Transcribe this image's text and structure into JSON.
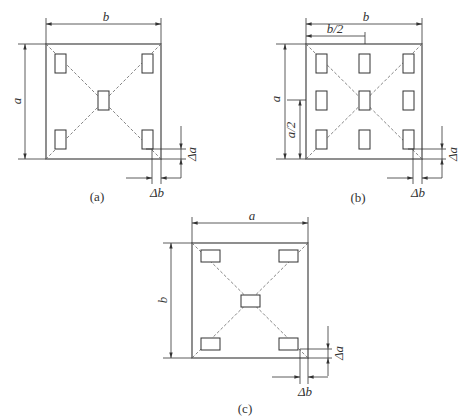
{
  "figures": [
    {
      "id": "a",
      "caption": "(a)",
      "labels": {
        "width": "b",
        "height": "a",
        "delta_a": "Δa",
        "delta_b": "Δb"
      },
      "pads": "5 pads: 4 corners + center, vertical orientation"
    },
    {
      "id": "b",
      "caption": "(b)",
      "labels": {
        "width": "b",
        "half_width": "b/2",
        "height": "a",
        "half_height": "a/2",
        "delta_a": "Δa",
        "delta_b": "Δb"
      },
      "pads": "9 pads: 3×3 grid, vertical orientation"
    },
    {
      "id": "c",
      "caption": "(c)",
      "labels": {
        "width": "a",
        "height": "b",
        "delta_a": "Δa",
        "delta_b": "Δb"
      },
      "pads": "5 pads: 4 corners + center, horizontal orientation"
    }
  ],
  "colors": {
    "line": "#333333",
    "dashed": "#666666",
    "background": "#ffffff"
  }
}
